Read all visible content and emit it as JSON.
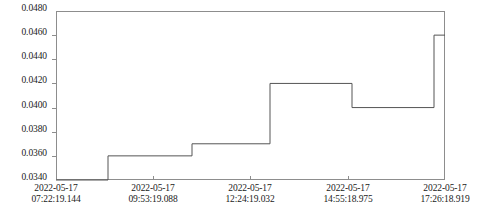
{
  "chart_data": {
    "type": "line",
    "line_style": "step-post",
    "title": "",
    "xlabel": "",
    "ylabel": "",
    "ylim": [
      0.034,
      0.048
    ],
    "xlim": [
      "2022-05-17 07:22:19.144",
      "2022-05-17 18:04:00.000"
    ],
    "grid": false,
    "legend": null,
    "y_ticks": [
      "0.0340",
      "0.0360",
      "0.0380",
      "0.0400",
      "0.0420",
      "0.0440",
      "0.0460",
      "0.0480"
    ],
    "y_tick_values": [
      0.034,
      0.036,
      0.038,
      0.04,
      0.042,
      0.044,
      0.046,
      0.048
    ],
    "x_ticks": [
      {
        "line1": "2022-05-17",
        "line2": "07:22:19.144"
      },
      {
        "line1": "2022-05-17",
        "line2": "09:53:19.088"
      },
      {
        "line1": "2022-05-17",
        "line2": "12:24:19.032"
      },
      {
        "line1": "2022-05-17",
        "line2": "14:55:18.975"
      },
      {
        "line1": "2022-05-17",
        "line2": "17:26:18.919"
      }
    ],
    "x_tick_positions_px": [
      56,
      153,
      250,
      348,
      445
    ],
    "series": [
      {
        "name": "value",
        "color": "#555555",
        "step_points": [
          {
            "x_px": 56,
            "value": 0.034
          },
          {
            "x_px": 108,
            "value": 0.036
          },
          {
            "x_px": 192,
            "value": 0.037
          },
          {
            "x_px": 270,
            "value": 0.042
          },
          {
            "x_px": 352,
            "value": 0.04
          },
          {
            "x_px": 434,
            "value": 0.046
          },
          {
            "x_px": 445,
            "value": 0.046
          }
        ],
        "values": [
          0.034,
          0.036,
          0.037,
          0.042,
          0.04,
          0.046
        ]
      }
    ]
  },
  "colors": {
    "line": "#555555",
    "axis": "#8d8d8d",
    "text": "#1a1a1a",
    "background": "#ffffff"
  }
}
